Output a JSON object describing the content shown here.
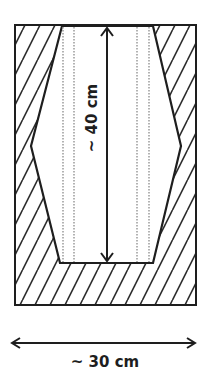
{
  "diagram": {
    "colors": {
      "stroke": "#1e1e1e",
      "hatch": "#2a2a2a",
      "dotted": "#8a8a8a",
      "background": "#ffffff",
      "cavity": "#ffffff"
    },
    "outer_block": {
      "label": "hatched block",
      "x": 15,
      "y": 25,
      "width": 181,
      "height": 280
    },
    "cavity": {
      "label": "hexagonal cavity",
      "points": "62,26 153,26 181,146 153,263 60,263 31,146"
    },
    "dotted_guides": [
      {
        "x": 63,
        "y1": 27,
        "y2": 262
      },
      {
        "x": 74,
        "y1": 27,
        "y2": 262
      },
      {
        "x": 137,
        "y1": 27,
        "y2": 262
      },
      {
        "x": 149,
        "y1": 27,
        "y2": 262
      }
    ],
    "height_dimension": {
      "label": "~ 40 cm",
      "x": 107,
      "y1": 28,
      "y2": 261
    },
    "width_dimension": {
      "label": "~ 30 cm",
      "y": 343,
      "x1": 12,
      "x2": 195
    }
  }
}
